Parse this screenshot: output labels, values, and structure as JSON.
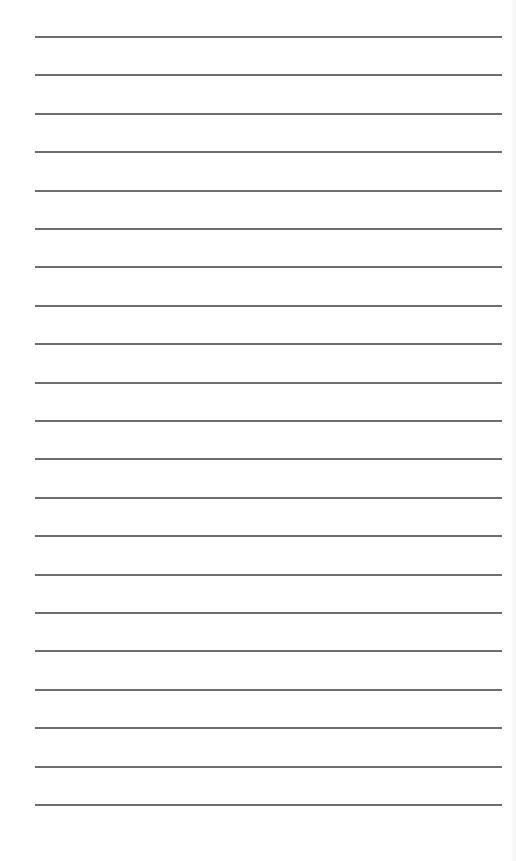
{
  "page": {
    "type": "lined-paper",
    "background_color": "#ffffff",
    "rule_color": "#6e6e6e",
    "rule_count": 21,
    "rule_left": 35,
    "rule_width": 467,
    "rule_thickness": 2,
    "rules_y": [
      36,
      74,
      113,
      151,
      190,
      228,
      266,
      305,
      343,
      382,
      420,
      458,
      497,
      535,
      574,
      612,
      650,
      689,
      727,
      766,
      804
    ]
  }
}
